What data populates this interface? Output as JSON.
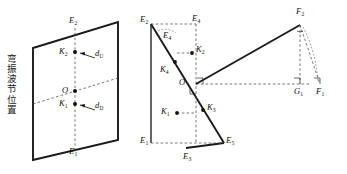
{
  "figure": {
    "caption_vertical": "弯振波节位置",
    "caption_chars": [
      "弯",
      "振",
      "波",
      "节",
      "位",
      "置"
    ],
    "stroke_color": "#1a1a1a",
    "dash_color": "#4a4a4a",
    "background": "#ffffff"
  },
  "panel_left": {
    "name": "parallelogram-plane",
    "labels": {
      "top_edge": "E",
      "top_edge_sub": "2",
      "bottom_edge": "E",
      "bottom_edge_sub": "1",
      "center": "O",
      "node_upper": "K",
      "node_upper_sub": "2",
      "node_lower": "K",
      "node_lower_sub": "1",
      "dist_upper": "d",
      "dist_upper_sub": "U",
      "dist_lower": "d",
      "dist_lower_sub": "D"
    }
  },
  "panel_middle": {
    "name": "projected-plane",
    "labels": {
      "e2": "E",
      "e2_sub": "2",
      "e4_corner": "E",
      "e4_corner_sub": "4",
      "e4_line": "E",
      "e4_line_sub": "4",
      "e1": "E",
      "e1_sub": "1",
      "e3": "E",
      "e3_sub": "3",
      "e5": "E",
      "e5_sub": "5",
      "k4": "K",
      "k4_sub": "4",
      "k2": "K",
      "k2_sub": "2",
      "k1": "K",
      "k1_sub": "1",
      "k3": "K",
      "k3_sub": "3",
      "origin": "O"
    }
  },
  "panel_right": {
    "name": "force-triangle",
    "labels": {
      "apex": "F",
      "apex_sub": "2",
      "base_left": "G",
      "base_left_sub": "1",
      "base_right": "F",
      "base_right_sub": "1"
    }
  }
}
